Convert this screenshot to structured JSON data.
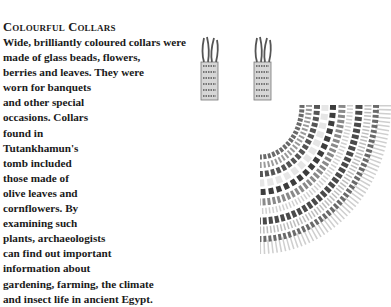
{
  "article": {
    "title": "Colourful Collars",
    "lines": [
      "Wide, brilliantly coloured collars were",
      "made of glass beads, flowers,",
      "berries and leaves. They were",
      "worn for banquets",
      "and other special",
      "occasions. Collars",
      "found in",
      "Tutankhamun's",
      "tomb included",
      "those made of",
      "olive leaves and",
      "cornflowers. By",
      "examining such",
      "plants, archaeologists",
      "can find out important",
      "information about",
      "gardening, farming, the climate",
      "and insect life in ancient Egypt."
    ]
  },
  "illustration": {
    "subject": "beaded-floral-collar",
    "colors": {
      "dark": "#3a3a3a",
      "mid": "#7a7a7a",
      "light": "#c8c8c8",
      "white": "#f2f2f2"
    }
  }
}
